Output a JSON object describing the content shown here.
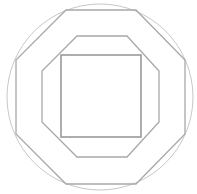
{
  "diagram": {
    "canvas": {
      "width": 197,
      "height": 194,
      "background": "#ffffff"
    },
    "shapes": {
      "circle": {
        "cx": 100,
        "cy": 97,
        "r": 93,
        "stroke": "#c8c8c8",
        "stroke_width": 1
      },
      "outer_octagon": {
        "points": "66,10 136,10 185,60 185,134 136,184 66,184 16,134 16,60",
        "stroke": "#a8a8a8",
        "stroke_width": 1.3
      },
      "middle_octagon": {
        "points": "77,36 127,36 159,71 159,122 127,157 77,157 42,122 42,71",
        "stroke": "#a8a8a8",
        "stroke_width": 1.3
      },
      "inner_square": {
        "x": 61,
        "y": 55,
        "width": 80,
        "height": 82,
        "stroke": "#999999",
        "stroke_width": 1.6
      }
    }
  }
}
